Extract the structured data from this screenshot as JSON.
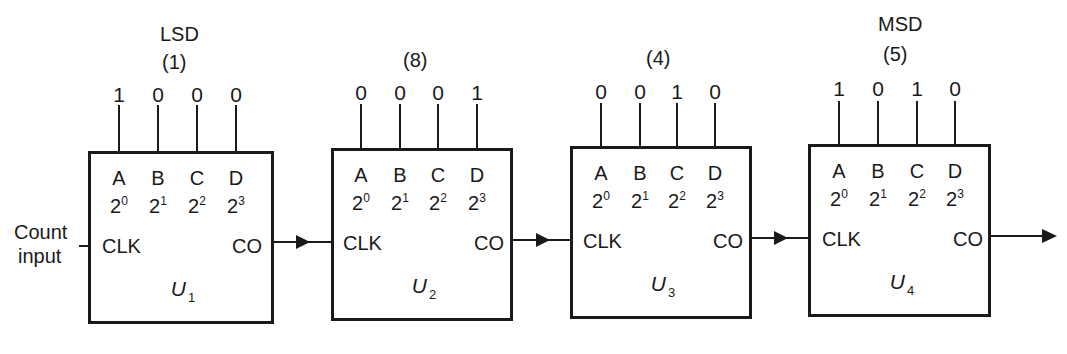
{
  "diagram": {
    "type": "cascaded BCD counter",
    "input_label_line1": "Count",
    "input_label_line2": "input",
    "counters": [
      {
        "name": "U",
        "index": "1",
        "top_label": "LSD",
        "decimal_label": "(1)",
        "bits": [
          "1",
          "0",
          "0",
          "0"
        ],
        "outputs": [
          "A",
          "B",
          "C",
          "D"
        ],
        "weights_base": [
          "2",
          "2",
          "2",
          "2"
        ],
        "weights_exp": [
          "0",
          "1",
          "2",
          "3"
        ],
        "clk_label": "CLK",
        "co_label": "CO"
      },
      {
        "name": "U",
        "index": "2",
        "top_label": "",
        "decimal_label": "(8)",
        "bits": [
          "0",
          "0",
          "0",
          "1"
        ],
        "outputs": [
          "A",
          "B",
          "C",
          "D"
        ],
        "weights_base": [
          "2",
          "2",
          "2",
          "2"
        ],
        "weights_exp": [
          "0",
          "1",
          "2",
          "3"
        ],
        "clk_label": "CLK",
        "co_label": "CO"
      },
      {
        "name": "U",
        "index": "3",
        "top_label": "",
        "decimal_label": "(4)",
        "bits": [
          "0",
          "0",
          "1",
          "0"
        ],
        "outputs": [
          "A",
          "B",
          "C",
          "D"
        ],
        "weights_base": [
          "2",
          "2",
          "2",
          "2"
        ],
        "weights_exp": [
          "0",
          "1",
          "2",
          "3"
        ],
        "clk_label": "CLK",
        "co_label": "CO"
      },
      {
        "name": "U",
        "index": "4",
        "top_label": "MSD",
        "decimal_label": "(5)",
        "bits": [
          "1",
          "0",
          "1",
          "0"
        ],
        "outputs": [
          "A",
          "B",
          "C",
          "D"
        ],
        "weights_base": [
          "2",
          "2",
          "2",
          "2"
        ],
        "weights_exp": [
          "0",
          "1",
          "2",
          "3"
        ],
        "clk_label": "CLK",
        "co_label": "CO"
      }
    ]
  }
}
